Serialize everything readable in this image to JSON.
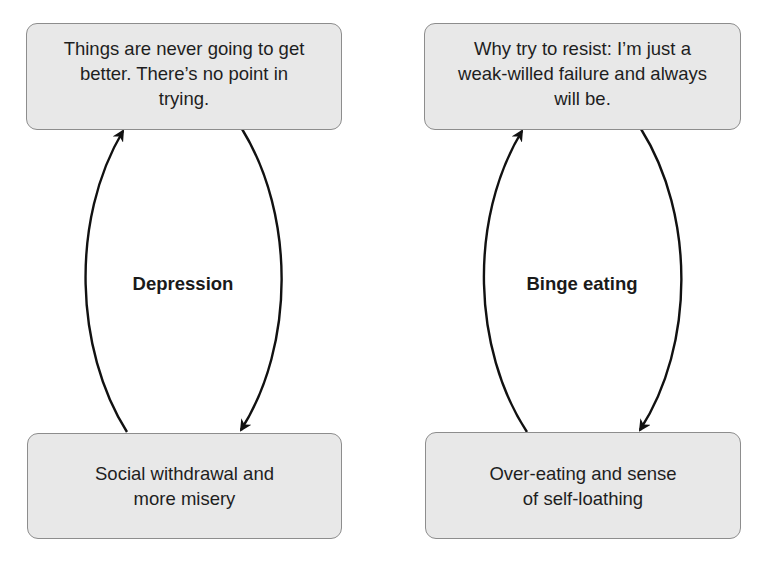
{
  "diagram": {
    "type": "vicious-cycle",
    "colors": {
      "box_fill": "#e8e8e8",
      "box_border": "#8d8d8d",
      "arrow": "#111111",
      "text": "#1e1e1e"
    },
    "cycles": [
      {
        "label": "Depression",
        "top_box": {
          "lines": [
            "Things are never going to get",
            "better. There’s no point in",
            "trying."
          ]
        },
        "bottom_box": {
          "lines": [
            "Social withdrawal and",
            "more misery"
          ]
        },
        "edges": [
          {
            "from": "top_box",
            "to": "bottom_box",
            "direction": "down"
          },
          {
            "from": "bottom_box",
            "to": "top_box",
            "direction": "up"
          }
        ]
      },
      {
        "label": "Binge eating",
        "top_box": {
          "lines": [
            "Why try to resist: I’m just a",
            "weak-willed failure and always",
            "will be."
          ]
        },
        "bottom_box": {
          "lines": [
            "Over-eating and sense",
            "of self-loathing"
          ]
        },
        "edges": [
          {
            "from": "top_box",
            "to": "bottom_box",
            "direction": "down"
          },
          {
            "from": "bottom_box",
            "to": "top_box",
            "direction": "up"
          }
        ]
      }
    ]
  }
}
